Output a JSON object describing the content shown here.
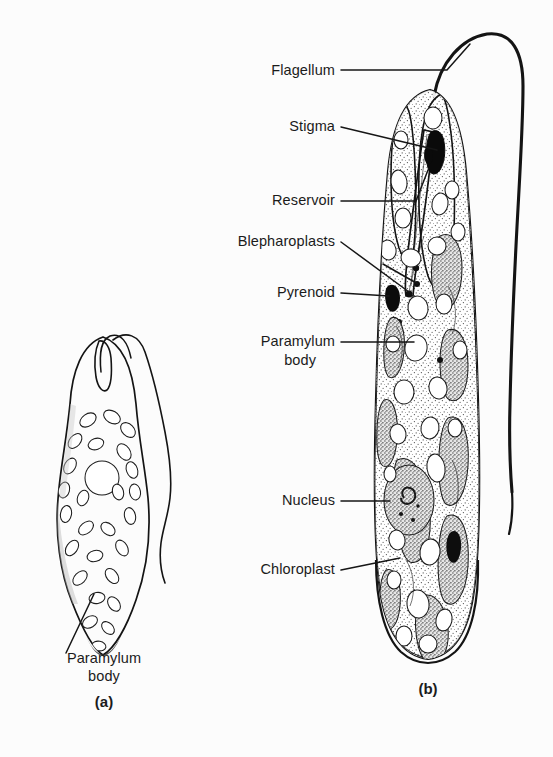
{
  "figure": {
    "title_caption": "",
    "background_color": "#fcfcfc",
    "ink_color": "#141414",
    "panels": [
      {
        "id": "a",
        "label": "(a)",
        "label_x": 104,
        "label_y": 694,
        "description": "Euglena whole cell, stippled spindle shape with paramylum bodies and central nucleus"
      },
      {
        "id": "b",
        "label": "(b)",
        "label_x": 428,
        "label_y": 694,
        "description": "Euglena cut-away showing internal organelles and pellicle striations"
      }
    ],
    "labels": [
      {
        "name": "flagellum",
        "text": "Flagellum",
        "x": 335,
        "y": 75,
        "align": "end",
        "lines": 1
      },
      {
        "name": "stigma",
        "text": "Stigma",
        "x": 335,
        "y": 131,
        "align": "end",
        "lines": 1
      },
      {
        "name": "reservoir",
        "text": "Reservoir",
        "x": 335,
        "y": 205,
        "align": "end",
        "lines": 1
      },
      {
        "name": "blepharoplasts",
        "text": "Blepharoplasts",
        "x": 335,
        "y": 246,
        "align": "end",
        "lines": 1
      },
      {
        "name": "pyrenoid",
        "text": "Pyrenoid",
        "x": 335,
        "y": 297,
        "align": "end",
        "lines": 1
      },
      {
        "name": "paramylum-body-b",
        "text": "Paramylum",
        "x": 335,
        "y": 346,
        "align": "end",
        "lines": 2,
        "text2": "body",
        "x2": 316,
        "y2": 365
      },
      {
        "name": "nucleus",
        "text": "Nucleus",
        "x": 335,
        "y": 505,
        "align": "end",
        "lines": 1
      },
      {
        "name": "chloroplast",
        "text": "Chloroplast",
        "x": 335,
        "y": 574,
        "align": "end",
        "lines": 1
      },
      {
        "name": "paramylum-body-a",
        "text": "Paramylum",
        "x": 104,
        "y": 663,
        "align": "middle",
        "lines": 2,
        "text2": "body",
        "x2": 104,
        "y2": 681
      }
    ]
  }
}
